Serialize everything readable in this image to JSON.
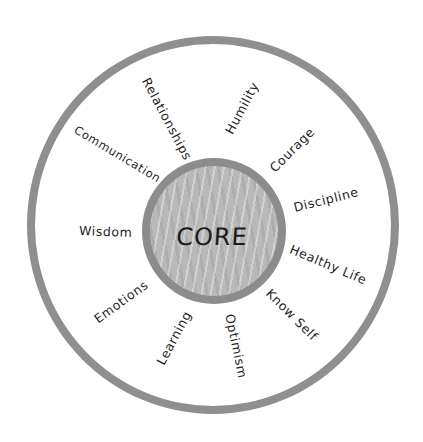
{
  "diagram": {
    "type": "concentric-circle-diagram",
    "colors": {
      "ring": "#8f8f8f",
      "core_fill": "#b9b9b9",
      "core_border": "#8c8c8c",
      "text": "#1e1e1e",
      "background": "#ffffff"
    },
    "center": {
      "label": "CORE"
    },
    "labels": [
      {
        "id": "relationships",
        "text": "Relationships"
      },
      {
        "id": "humility",
        "text": "Humility"
      },
      {
        "id": "communication",
        "text": "Communication"
      },
      {
        "id": "courage",
        "text": "Courage"
      },
      {
        "id": "discipline",
        "text": "Discipline"
      },
      {
        "id": "wisdom",
        "text": "Wisdom"
      },
      {
        "id": "healthy-life",
        "text": "Healthy Life"
      },
      {
        "id": "emotions",
        "text": "Emotions"
      },
      {
        "id": "know-self",
        "text": "Know Self"
      },
      {
        "id": "learning",
        "text": "Learning"
      },
      {
        "id": "optimism",
        "text": "Optimism"
      }
    ]
  }
}
